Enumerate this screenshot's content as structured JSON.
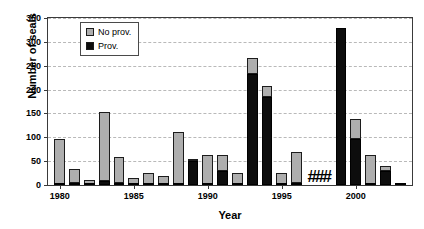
{
  "chart_data": {
    "type": "bar",
    "title": "",
    "xlabel": "Year",
    "ylabel": "Number of seals",
    "ylim": [
      0,
      350
    ],
    "xlim": [
      1979.2,
      2003.8
    ],
    "ytick_values": [
      0,
      50,
      100,
      150,
      200,
      250,
      300,
      350
    ],
    "ytick_labels": [
      "0",
      "50",
      "100",
      "150",
      "200",
      "250",
      "300",
      "350"
    ],
    "xtick_values": [
      1980,
      1985,
      1990,
      1995,
      2000
    ],
    "xtick_labels": [
      "1980",
      "1985",
      "1990",
      "1995",
      "2000"
    ],
    "grid": "horizontal-dashed",
    "stacked": true,
    "legend_position": "top-left-inside",
    "categories": [
      1980,
      1981,
      1982,
      1983,
      1984,
      1985,
      1986,
      1987,
      1988,
      1989,
      1990,
      1991,
      1992,
      1993,
      1994,
      1995,
      1996,
      1997,
      1998,
      1999,
      2000,
      2001,
      2002,
      2003
    ],
    "series": [
      {
        "name": "Prov.",
        "color": "#0d0d0d",
        "values": [
          3,
          4,
          1,
          9,
          4,
          3,
          1,
          1,
          1,
          50,
          2,
          30,
          1,
          232,
          185,
          1,
          4,
          0,
          0,
          330,
          97,
          1,
          30,
          1
        ]
      },
      {
        "name": "No prov.",
        "color": "#aeaeae",
        "values": [
          94,
          29,
          9,
          144,
          54,
          11,
          24,
          17,
          111,
          5,
          60,
          32,
          24,
          35,
          22,
          24,
          66,
          0,
          0,
          0,
          42,
          61,
          10,
          4
        ]
      }
    ],
    "totals": [
      97,
      33,
      10,
      153,
      58,
      14,
      25,
      18,
      112,
      55,
      62,
      62,
      25,
      267,
      207,
      25,
      70,
      0,
      0,
      330,
      139,
      62,
      40,
      5
    ],
    "annotations": [
      {
        "type": "missing-data-marker",
        "text": "##",
        "x_range": [
          1997,
          1998
        ],
        "note": "no data collected"
      }
    ]
  },
  "legend": {
    "items": [
      {
        "label": "No prov.",
        "swatch": "noprov"
      },
      {
        "label": "Prov.",
        "swatch": "prov"
      }
    ]
  },
  "axes": {
    "y_title": "Number of seals",
    "x_title": "Year"
  }
}
